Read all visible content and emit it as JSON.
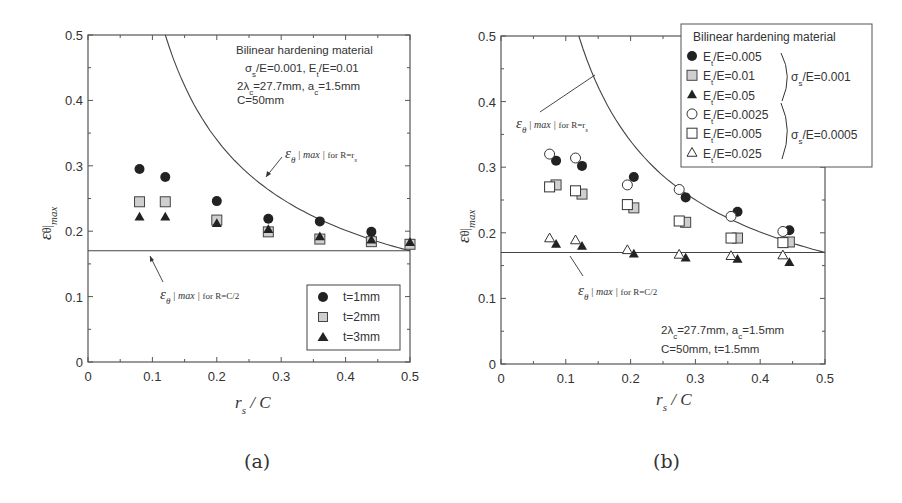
{
  "chart_data": [
    {
      "panel": "a",
      "type": "scatter",
      "caption": "(a)",
      "xlabel": "r_s / C",
      "ylabel": "ε_θ|max",
      "xlim": [
        0,
        0.5
      ],
      "ylim": [
        0,
        0.5
      ],
      "xticks": [
        "0",
        "0.1",
        "0.2",
        "0.3",
        "0.4",
        "0.5"
      ],
      "yticks": [
        "0",
        "0.1",
        "0.2",
        "0.3",
        "0.4",
        "0.5"
      ],
      "grid": false,
      "legend_position": "lower right",
      "annotation_lines": [
        "Bilinear hardening material",
        "σs/E=0.001, Et/E=0.01",
        "2λc=27.7mm, ac=1.5mm",
        "C=50mm"
      ],
      "reference_curves": [
        {
          "name": "ε_θ|max| for R=r_s",
          "kind": "curve",
          "x": [
            0.12,
            0.15,
            0.2,
            0.25,
            0.3,
            0.35,
            0.4,
            0.45,
            0.5
          ],
          "y": [
            0.5,
            0.423,
            0.339,
            0.286,
            0.25,
            0.223,
            0.203,
            0.185,
            0.17
          ]
        },
        {
          "name": "ε_θ|max| for R=C/2",
          "kind": "hline",
          "y": 0.17
        }
      ],
      "series": [
        {
          "name": "t=1mm",
          "marker": "circle-filled",
          "x": [
            0.08,
            0.12,
            0.2,
            0.28,
            0.36,
            0.44,
            0.5
          ],
          "y": [
            0.295,
            0.283,
            0.246,
            0.219,
            0.215,
            0.199,
            0.181
          ]
        },
        {
          "name": "t=2mm",
          "marker": "square-gray",
          "x": [
            0.08,
            0.12,
            0.2,
            0.28,
            0.36,
            0.44,
            0.5
          ],
          "y": [
            0.245,
            0.245,
            0.217,
            0.199,
            0.188,
            0.184,
            0.18
          ]
        },
        {
          "name": "t=3mm",
          "marker": "triangle-filled",
          "x": [
            0.08,
            0.12,
            0.2,
            0.28,
            0.36,
            0.44,
            0.5
          ],
          "y": [
            0.222,
            0.222,
            0.212,
            0.203,
            0.192,
            0.187,
            0.183
          ]
        }
      ]
    },
    {
      "panel": "b",
      "type": "scatter",
      "caption": "(b)",
      "xlabel": "r_s / C",
      "ylabel": "ε_θ|max",
      "xlim": [
        0,
        0.5
      ],
      "ylim": [
        0,
        0.5
      ],
      "xticks": [
        "0",
        "0.1",
        "0.2",
        "0.3",
        "0.4",
        "0.5"
      ],
      "yticks": [
        "0",
        "0.1",
        "0.2",
        "0.3",
        "0.4",
        "0.5"
      ],
      "grid": false,
      "legend_position": "upper right (outside frame)",
      "legend_title": "Bilinear hardening material",
      "legend_groups": [
        {
          "label": "σs/E=0.001",
          "members": [
            "Et/E=0.005",
            "Et/E=0.01",
            "Et/E=0.05"
          ]
        },
        {
          "label": "σs/E=0.0005",
          "members": [
            "Et/E=0.0025",
            "Et/E=0.005",
            "Et/E=0.025"
          ]
        }
      ],
      "annotation_lines": [
        "2λc=27.7mm, ac=1.5mm",
        "C=50mm, t=1.5mm"
      ],
      "reference_curves": [
        {
          "name": "ε_θ|max| for R=r_s",
          "kind": "curve",
          "x": [
            0.12,
            0.15,
            0.2,
            0.25,
            0.3,
            0.35,
            0.4,
            0.45,
            0.5
          ],
          "y": [
            0.5,
            0.423,
            0.339,
            0.286,
            0.25,
            0.223,
            0.203,
            0.185,
            0.17
          ]
        },
        {
          "name": "ε_θ|max| for R=C/2",
          "kind": "hline",
          "y": 0.17
        }
      ],
      "series": [
        {
          "name": "Et/E=0.005",
          "group": "σs/E=0.001",
          "marker": "circle-filled",
          "x": [
            0.085,
            0.125,
            0.205,
            0.285,
            0.365,
            0.445
          ],
          "y": [
            0.31,
            0.302,
            0.285,
            0.254,
            0.232,
            0.204
          ]
        },
        {
          "name": "Et/E=0.01",
          "group": "σs/E=0.001",
          "marker": "square-gray",
          "x": [
            0.085,
            0.125,
            0.205,
            0.285,
            0.365,
            0.445
          ],
          "y": [
            0.273,
            0.259,
            0.238,
            0.216,
            0.192,
            0.186
          ]
        },
        {
          "name": "Et/E=0.05",
          "group": "σs/E=0.001",
          "marker": "triangle-filled",
          "x": [
            0.085,
            0.125,
            0.205,
            0.285,
            0.365,
            0.445
          ],
          "y": [
            0.183,
            0.18,
            0.168,
            0.162,
            0.16,
            0.155
          ]
        },
        {
          "name": "Et/E=0.0025",
          "group": "σs/E=0.0005",
          "marker": "circle-open",
          "x": [
            0.075,
            0.115,
            0.195,
            0.275,
            0.355,
            0.435
          ],
          "y": [
            0.32,
            0.314,
            0.273,
            0.266,
            0.225,
            0.202
          ]
        },
        {
          "name": "Et/E=0.005",
          "group": "σs/E=0.0005",
          "marker": "square-open",
          "x": [
            0.075,
            0.115,
            0.195,
            0.275,
            0.355,
            0.435
          ],
          "y": [
            0.27,
            0.264,
            0.243,
            0.218,
            0.192,
            0.185
          ]
        },
        {
          "name": "Et/E=0.025",
          "group": "σs/E=0.0005",
          "marker": "triangle-open",
          "x": [
            0.075,
            0.115,
            0.195,
            0.275,
            0.355,
            0.435
          ],
          "y": [
            0.192,
            0.189,
            0.174,
            0.167,
            0.165,
            0.166
          ]
        }
      ]
    }
  ],
  "figure": {
    "panel_a": {
      "caption": "(a)",
      "xlabel_main": "r",
      "xlabel_sub": "s",
      "xlabel_rest": " / C",
      "ylabel_main": "ε",
      "ylabel_sub": "θ",
      "ylabel_rest": "max",
      "annotation": [
        "Bilinear hardening material",
        "σ",
        "s",
        "/E=0.001, E",
        "t",
        "/E=0.01",
        "2λ",
        "c",
        "=27.7mm, a",
        "c",
        "=1.5mm",
        "C=50mm"
      ],
      "curve_label": {
        "eps": "ε",
        "sub": "θ",
        "mid": "max",
        "rest": "for R=r",
        "end": "s"
      },
      "hline_label": {
        "eps": "ε",
        "sub": "θ",
        "mid": "max",
        "rest": "for R=C/2"
      },
      "legend": [
        "t=1mm",
        "t=2mm",
        "t=3mm"
      ]
    },
    "panel_b": {
      "caption": "(b)",
      "legend_title": "Bilinear hardening material",
      "legend_items": [
        "/E=0.005",
        "/E=0.01",
        "/E=0.05",
        "/E=0.0025",
        "/E=0.005",
        "/E=0.025"
      ],
      "legend_prefix": "E",
      "legend_prefix_sub": "t",
      "group1": {
        "sym": "σ",
        "sub": "s",
        "rest": "/E=0.001"
      },
      "group2": {
        "sym": "σ",
        "sub": "s",
        "rest": "/E=0.0005"
      },
      "annotation": [
        "2λ",
        "c",
        "=27.7mm, a",
        "c",
        "=1.5mm",
        "C=50mm, t=1.5mm"
      ]
    }
  },
  "colors": {
    "ink": "#333333",
    "frame": "#555555",
    "gray_fill": "#cfcfcf",
    "filled": "#222222"
  }
}
